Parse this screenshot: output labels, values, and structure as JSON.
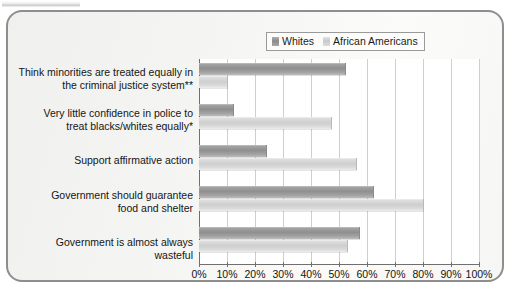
{
  "legend": {
    "items": [
      {
        "label": "Whites",
        "color": "#8f8f8f",
        "icon": "legend-swatch"
      },
      {
        "label": "African Americans",
        "color": "#cfcfcf",
        "icon": "legend-swatch"
      }
    ]
  },
  "chart_data": {
    "type": "bar",
    "orientation": "horizontal",
    "title": "",
    "subtitle": "",
    "xlabel": "",
    "ylabel": "",
    "xlim": [
      0,
      100
    ],
    "grid": "vertical",
    "legend_position": "top-right",
    "categories": [
      "Think minorities are treated equally in the criminal justice system**",
      "Very little confidence in police to treat blacks/whites equally*",
      "Support affirmative action",
      "Government should guarantee food and shelter",
      "Government is almost always wasteful"
    ],
    "category_lines": [
      [
        "Think minorities are treated equally in",
        "the criminal justice system**"
      ],
      [
        "Very little confidence in police to",
        "treat blacks/whites equally*"
      ],
      [
        "Support affirmative action"
      ],
      [
        "Government should guarantee",
        "food and shelter"
      ],
      [
        "Government is almost always wasteful"
      ]
    ],
    "series": [
      {
        "name": "Whites",
        "values": [
          52,
          12,
          24,
          62,
          57
        ]
      },
      {
        "name": "African Americans",
        "values": [
          10,
          47,
          56,
          80,
          53
        ]
      }
    ],
    "xticks": [
      "0%",
      "10%",
      "20%",
      "30%",
      "40%",
      "50%",
      "60%",
      "70%",
      "80%",
      "90%",
      "100%"
    ],
    "xtick_values": [
      0,
      10,
      20,
      30,
      40,
      50,
      60,
      70,
      80,
      90,
      100
    ],
    "footnotes": [
      "*",
      "**"
    ]
  }
}
